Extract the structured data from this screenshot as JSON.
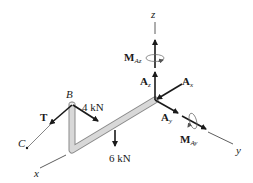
{
  "diagram": {
    "type": "free-body diagram",
    "axes": {
      "x": "x",
      "y": "y",
      "z": "z"
    },
    "points": {
      "B": "B",
      "C": "C"
    },
    "forces": {
      "tension": {
        "symbol": "T"
      },
      "load_4": {
        "label": "4 kN"
      },
      "load_6": {
        "label": "6 kN"
      },
      "Ax": {
        "main": "A",
        "sub": "x"
      },
      "Ay": {
        "main": "A",
        "sub": "y"
      },
      "Az": {
        "main": "A",
        "sub": "z"
      }
    },
    "moments": {
      "MAz": {
        "main": "M",
        "sub": "Az"
      },
      "MAy": {
        "main": "M",
        "sub": "Ay"
      }
    },
    "colors": {
      "ink": "#1a1a1a",
      "pipe_fill": "#d4d4d4",
      "pipe_edge": "#8a8a8a",
      "axis": "#333333"
    }
  }
}
